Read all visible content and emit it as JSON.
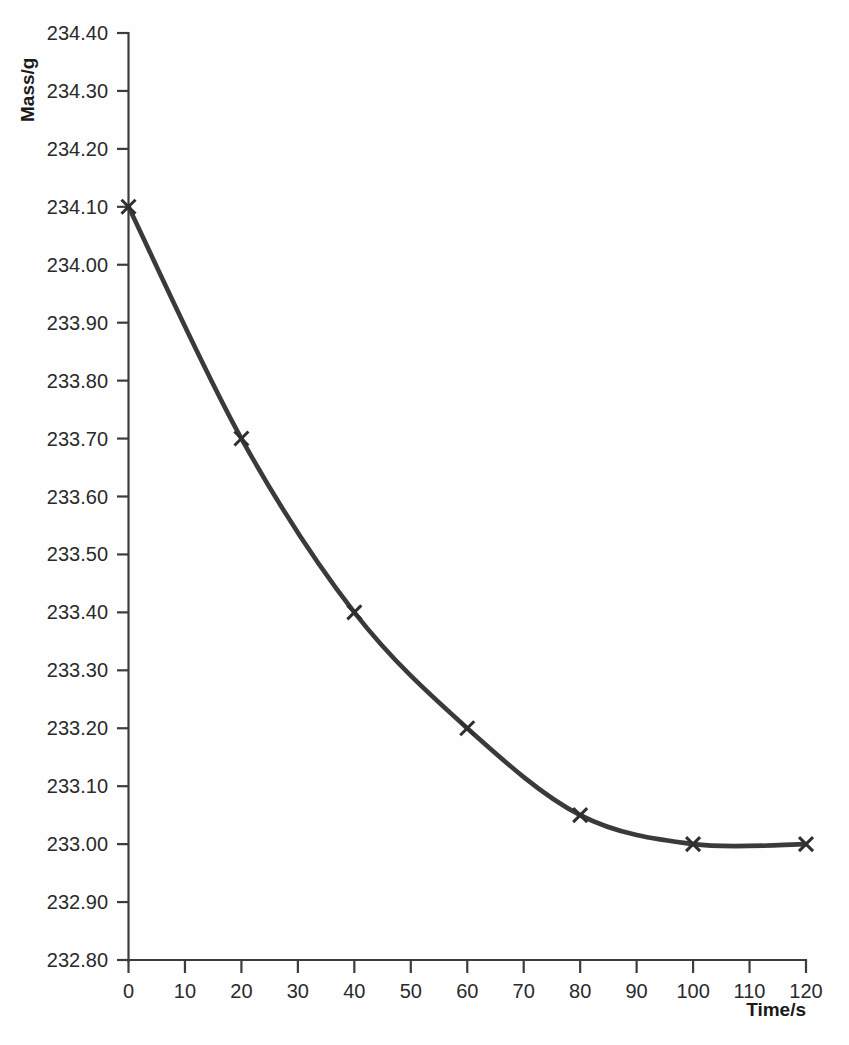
{
  "chart_data": {
    "type": "line",
    "title": "",
    "subtitle": "",
    "xlabel": "Time/s",
    "ylabel": "Mass/g",
    "xlim": [
      0,
      120
    ],
    "ylim": [
      232.8,
      234.4
    ],
    "grid": false,
    "legend": false,
    "marker": "x-cross",
    "line_color": "#3a3a3a",
    "x": [
      0,
      20,
      40,
      60,
      80,
      100,
      120
    ],
    "values": [
      234.1,
      233.7,
      233.4,
      233.2,
      233.05,
      233.0,
      233.0
    ],
    "series": [
      {
        "name": "Mass",
        "x": [
          0,
          20,
          40,
          60,
          80,
          100,
          120
        ],
        "values": [
          234.1,
          233.7,
          233.4,
          233.2,
          233.05,
          233.0,
          233.0
        ]
      }
    ],
    "xticks": [
      0,
      10,
      20,
      30,
      40,
      50,
      60,
      70,
      80,
      90,
      100,
      110,
      120
    ],
    "xtick_labels": [
      "0",
      "10",
      "20",
      "30",
      "40",
      "50",
      "60",
      "70",
      "80",
      "90",
      "100",
      "110",
      "120"
    ],
    "yticks": [
      234.4,
      234.3,
      234.2,
      234.1,
      234.0,
      233.9,
      233.8,
      233.7,
      233.6,
      233.5,
      233.4,
      233.3,
      233.2,
      233.1,
      233.0,
      232.9,
      232.8
    ],
    "ytick_labels": [
      "234.40",
      "234.30",
      "234.20",
      "234.10",
      "234.00",
      "233.90",
      "233.80",
      "233.70",
      "233.60",
      "233.50",
      "233.40",
      "233.30",
      "233.20",
      "233.10",
      "233.00",
      "232.90",
      "232.80"
    ],
    "annotations": []
  },
  "axes": {
    "y_axis_title": "Mass/g",
    "x_axis_title": "Time/s"
  }
}
